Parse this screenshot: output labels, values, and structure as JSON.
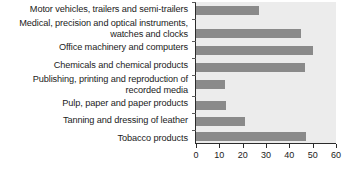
{
  "chart_data": {
    "type": "bar",
    "orientation": "horizontal",
    "title": "",
    "subtitle": "",
    "xlabel": "",
    "ylabel": "",
    "xlim": [
      0,
      60
    ],
    "ylim": null,
    "grid": false,
    "legend": null,
    "bar_color": "#8a8a8a",
    "plot_background": "#ececec",
    "axis_color": "#2b2b2b",
    "text_color": "#1b1b1b",
    "x_ticks": [
      0,
      10,
      20,
      30,
      40,
      50,
      60
    ],
    "x_tick_labels": [
      "0",
      "10",
      "20",
      "30",
      "40",
      "50",
      "60"
    ],
    "categories": [
      "Motor vehicles, trailers and semi-trailers",
      "Medical, precision and optical instruments,\nwatches and clocks",
      "Office machinery and computers",
      "Chemicals and chemical products",
      "Publishing, printing and reproduction of\nrecorded media",
      "Pulp, paper and paper products",
      "Tanning and dressing of leather",
      "Tobacco products"
    ],
    "values": [
      27,
      45,
      50,
      46.5,
      12.5,
      13,
      21,
      47
    ]
  }
}
